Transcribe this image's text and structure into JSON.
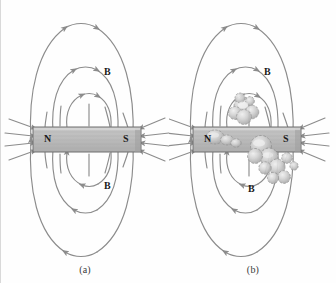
{
  "figure": {
    "type": "physics-diagram",
    "background_color": "#fefefe",
    "line_color": "#8c8c8c",
    "magnet_fill": "#bdbdbd",
    "magnet_stroke": "#6e6e6e",
    "label_color": "#1a1a1a"
  },
  "panels": [
    {
      "id": "a",
      "caption": "(a)",
      "magnet": {
        "north_label": "N",
        "south_label": "S"
      },
      "field_labels": [
        {
          "text": "B",
          "position": "upper"
        },
        {
          "text": "B",
          "position": "lower"
        }
      ]
    },
    {
      "id": "b",
      "caption": "(b)",
      "magnet": {
        "north_label": "N",
        "south_label": "S"
      },
      "field_labels": [
        {
          "text": "B",
          "position": "upper"
        },
        {
          "text": "B",
          "position": "lower"
        }
      ],
      "clusters_present": true
    }
  ]
}
